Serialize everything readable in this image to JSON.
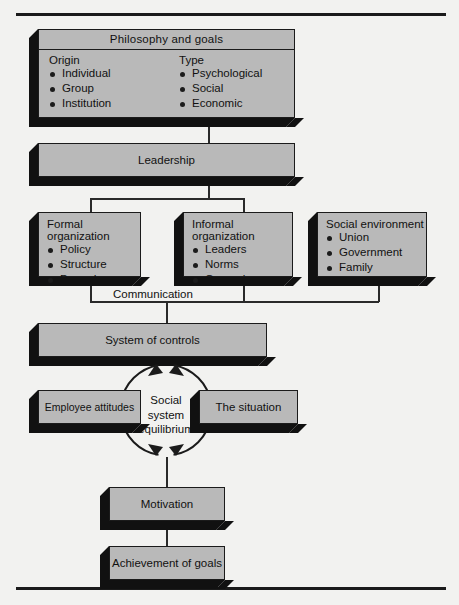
{
  "figure": {
    "type": "flow-diagram"
  },
  "nodes": {
    "philosophy": {
      "title": "Philosophy and goals",
      "columns": [
        {
          "header": "Origin",
          "items": [
            "Individual",
            "Group",
            "Institution"
          ]
        },
        {
          "header": "Type",
          "items": [
            "Psychological",
            "Social",
            "Economic"
          ]
        }
      ]
    },
    "leadership": {
      "label": "Leadership"
    },
    "formal_organization": {
      "label": "Formal organization",
      "items": [
        "Policy",
        "Structure",
        "Procedure"
      ]
    },
    "informal_organization": {
      "label": "Informal organization",
      "items": [
        "Leaders",
        "Norms",
        "Grapevine"
      ]
    },
    "social_environment": {
      "label": "Social environment",
      "items": [
        "Union",
        "Government",
        "Family"
      ]
    },
    "communication": {
      "label": "Communication"
    },
    "system_of_controls": {
      "label": "System of controls"
    },
    "employee_attitudes": {
      "label": "Employee attitudes"
    },
    "the_situation": {
      "label": "The situation"
    },
    "equilibrium": {
      "line1": "Social",
      "line2": "system",
      "line3": "equilibrium"
    },
    "motivation": {
      "label": "Motivation"
    },
    "achievement": {
      "label": "Achievement of goals"
    }
  },
  "style": {
    "box_fill": "#b9b9b9",
    "box_border": "#1b1b1b",
    "shadow_fill": "#111111",
    "page_bg": "#f2f2f0",
    "rule_color": "#1b1b1b"
  }
}
